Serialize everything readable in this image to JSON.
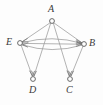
{
  "figure": {
    "kind": "directed-graph-diagram",
    "background_color": "#fdfdfd",
    "edge_color": "#9a9a9a",
    "node_stroke_color": "#5a5a5a",
    "label_color": "#3a3a3a",
    "width": 103,
    "height": 105
  },
  "nodes": [
    {
      "id": "A",
      "label": "A",
      "x": 52,
      "y": 21,
      "r": 2.4,
      "label_x": 48,
      "label_y": 5
    },
    {
      "id": "E",
      "label": "E",
      "x": 20,
      "y": 43,
      "r": 2.4,
      "label_x": 7,
      "label_y": 37
    },
    {
      "id": "B",
      "label": "B",
      "x": 84,
      "y": 44,
      "r": 2.4,
      "label_x": 89,
      "label_y": 38
    },
    {
      "id": "D",
      "label": "D",
      "x": 33,
      "y": 79,
      "r": 2.4,
      "label_x": 29,
      "label_y": 84
    },
    {
      "id": "C",
      "label": "C",
      "x": 70,
      "y": 79,
      "r": 2.4,
      "label_x": 66,
      "label_y": 84
    }
  ],
  "edges": [
    {
      "id": "A-E",
      "from": "A",
      "to": "E",
      "style": "straight",
      "arrow": "to"
    },
    {
      "id": "A-B",
      "from": "A",
      "to": "B",
      "style": "straight",
      "arrow": "to"
    },
    {
      "id": "A-D",
      "from": "A",
      "to": "D",
      "style": "straight",
      "arrow": "to"
    },
    {
      "id": "A-C",
      "from": "A",
      "to": "C",
      "style": "straight",
      "arrow": "to"
    },
    {
      "id": "E-B-upper",
      "from": "E",
      "to": "B",
      "style": "curve-up",
      "arrow": "to"
    },
    {
      "id": "B-E-lower",
      "from": "B",
      "to": "E",
      "style": "curve-down",
      "arrow": "to"
    },
    {
      "id": "E-B-straight",
      "from": "E",
      "to": "B",
      "style": "straight",
      "arrow": "to"
    },
    {
      "id": "E-D",
      "from": "E",
      "to": "D",
      "style": "straight",
      "arrow": "to"
    },
    {
      "id": "B-C",
      "from": "B",
      "to": "C",
      "style": "straight",
      "arrow": "to"
    }
  ]
}
